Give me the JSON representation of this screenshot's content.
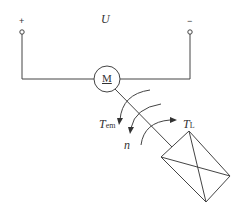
{
  "diagram": {
    "voltage_label": "U",
    "plus_sign": "+",
    "minus_sign": "−",
    "motor_label": "M",
    "torque_em": {
      "main": "T",
      "sub": "em"
    },
    "speed_label": "n",
    "torque_load": {
      "main": "T",
      "sub": "L"
    }
  },
  "colors": {
    "line": "#444444",
    "background": "#ffffff"
  }
}
